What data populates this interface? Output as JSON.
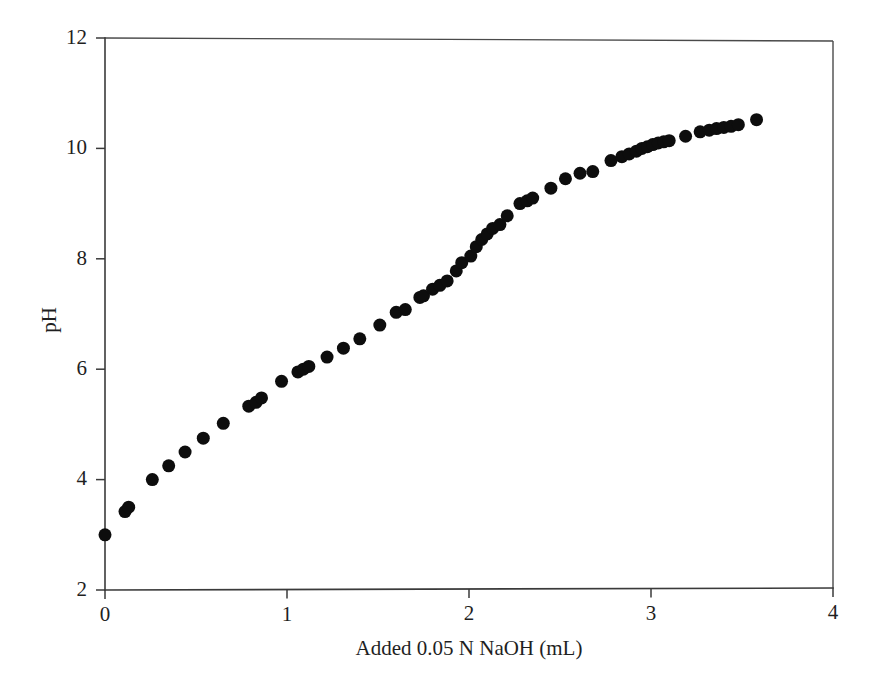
{
  "chart_data": {
    "type": "scatter",
    "title": "",
    "xlabel": "Added 0.05 N NaOH (mL)",
    "ylabel": "pH",
    "xlim": [
      0,
      4
    ],
    "ylim": [
      2,
      12
    ],
    "xticks": [
      "0",
      "1",
      "2",
      "3",
      "4"
    ],
    "xtick_values": [
      0,
      1,
      2,
      3,
      4
    ],
    "yticks": [
      "2",
      "4",
      "6",
      "8",
      "10",
      "12"
    ],
    "ytick_values": [
      2,
      4,
      6,
      8,
      10,
      12
    ],
    "grid": false,
    "legend": null,
    "marker": "filled-circle",
    "marker_color": "#0d0d0d",
    "marker_size_px": 13,
    "series": [
      {
        "name": "Titration curve",
        "x": [
          0.0,
          0.11,
          0.13,
          0.26,
          0.35,
          0.44,
          0.54,
          0.65,
          0.79,
          0.83,
          0.86,
          0.97,
          1.06,
          1.09,
          1.12,
          1.22,
          1.31,
          1.4,
          1.51,
          1.6,
          1.65,
          1.73,
          1.75,
          1.8,
          1.84,
          1.88,
          1.93,
          1.96,
          2.01,
          2.04,
          2.07,
          2.1,
          2.13,
          2.17,
          2.21,
          2.28,
          2.32,
          2.35,
          2.45,
          2.53,
          2.61,
          2.68,
          2.78,
          2.84,
          2.88,
          2.92,
          2.95,
          2.98,
          3.01,
          3.04,
          3.07,
          3.1,
          3.19,
          3.27,
          3.32,
          3.36,
          3.4,
          3.44,
          3.48,
          3.58
        ],
        "y": [
          3.0,
          3.42,
          3.5,
          4.0,
          4.25,
          4.5,
          4.75,
          5.02,
          5.33,
          5.4,
          5.48,
          5.78,
          5.95,
          6.0,
          6.05,
          6.22,
          6.38,
          6.55,
          6.8,
          7.03,
          7.08,
          7.3,
          7.33,
          7.45,
          7.52,
          7.6,
          7.78,
          7.93,
          8.05,
          8.22,
          8.35,
          8.45,
          8.55,
          8.62,
          8.78,
          9.0,
          9.05,
          9.1,
          9.28,
          9.45,
          9.55,
          9.58,
          9.78,
          9.85,
          9.9,
          9.95,
          10.0,
          10.03,
          10.07,
          10.1,
          10.12,
          10.14,
          10.22,
          10.3,
          10.33,
          10.36,
          10.38,
          10.4,
          10.43,
          10.52
        ]
      }
    ]
  },
  "axes": {
    "y_axis_label": "pH",
    "x_axis_label": "Added 0.05 N NaOH (mL)"
  }
}
